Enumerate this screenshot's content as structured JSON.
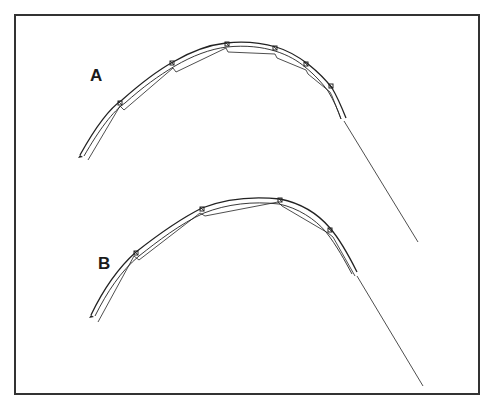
{
  "figure": {
    "frame": {
      "x": 15,
      "y": 15,
      "width": 464,
      "height": 379,
      "stroke": "#333333"
    },
    "line_color": "#222222",
    "panels": [
      {
        "id": "A",
        "label": "A",
        "outer_curve": "M80,155 C95,128 110,108 122,100 C140,84 155,72 173,62 C190,52 208,45 226,43 C245,41 262,43 276,47 C290,51 300,58 308,64 C318,72 326,80 332,88 C338,98 342,108 346,118",
        "outer_curve_2": "M84,156 C99,130 113,111 125,103 C143,87 158,76 175,66 C192,56 210,49 227,47 C246,45 262,47 275,51 C288,55 298,61 305,67 C315,75 322,83 328,91 C334,101 338,110 341,119",
        "inner_chords": "M88,160 L120,106 L124,110 L173,68 L176,72 L226,48 L228,52 L275,54 L277,58 L306,70 L308,74 L330,92 L332,96 L341,119",
        "joints": [
          [
            120,
            103
          ],
          [
            172,
            63
          ],
          [
            227,
            44
          ],
          [
            275,
            48
          ],
          [
            306,
            64
          ],
          [
            331,
            86
          ]
        ],
        "tail": {
          "x1": 344,
          "y1": 121,
          "x2": 418,
          "y2": 242
        },
        "left_tip": "M80,155 L78,158 L83,157 Z"
      },
      {
        "id": "B",
        "label": "B",
        "outer_curve": "M91,315 C103,290 118,268 136,252 C155,237 178,220 202,208 C225,199 252,196 280,199 C300,203 318,214 330,228 C342,242 350,258 357,272",
        "outer_curve_2": "M95,316 C107,292 121,271 139,256 C158,241 180,224 204,213 C227,204 253,201 279,204 C298,208 315,219 326,232 C337,246 345,261 352,274",
        "inner_chords": "M98,322 L134,256 L139,260 L200,213 L205,216 L278,202 L282,206 L328,233 L333,237 L355,276",
        "joints": [
          [
            136,
            253
          ],
          [
            202,
            209
          ],
          [
            280,
            200
          ],
          [
            330,
            230
          ]
        ],
        "tail": {
          "x1": 357,
          "y1": 276,
          "x2": 423,
          "y2": 386
        },
        "left_tip": "M91,315 L89,318 L94,317 Z"
      }
    ]
  }
}
